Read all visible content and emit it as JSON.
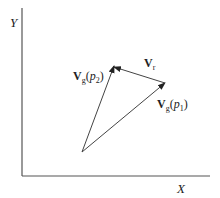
{
  "diagram": {
    "type": "vector-triangle",
    "colors": {
      "axis": "#555555",
      "vector": "#444444",
      "text": "#222222",
      "background": "#ffffff"
    },
    "axes": {
      "x_label": "X",
      "y_label": "Y"
    },
    "vectors": [
      {
        "id": "vg-p2",
        "symbol": "V",
        "subscript": "g",
        "argument": "p",
        "argument_subscript": "2",
        "from": "origin",
        "to": "p2"
      },
      {
        "id": "vg-p1",
        "symbol": "V",
        "subscript": "g",
        "argument": "p",
        "argument_subscript": "1",
        "from": "origin",
        "to": "p1"
      },
      {
        "id": "vr",
        "symbol": "V",
        "subscript": "r",
        "from": "p1",
        "to": "p2"
      }
    ],
    "labels": {
      "vg_p2": {
        "V": "V",
        "sub": "g",
        "open": "(",
        "p": "p",
        "psub": "2",
        "close": ")"
      },
      "vg_p1": {
        "V": "V",
        "sub": "g",
        "open": "(",
        "p": "p",
        "psub": "1",
        "close": ")"
      },
      "vr": {
        "V": "V",
        "sub": "r"
      }
    }
  }
}
